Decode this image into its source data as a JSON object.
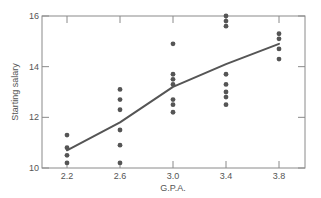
{
  "chart_data": {
    "type": "scatter",
    "title": "",
    "xlabel": "G.P.A.",
    "ylabel": "Starting salary",
    "xlim": [
      2.0,
      4.0
    ],
    "ylim": [
      10,
      16
    ],
    "x_ticks": [
      2.2,
      2.6,
      3.0,
      3.4,
      3.8
    ],
    "x_tick_labels": [
      "2.2",
      "2.6",
      "3.0",
      "3.4",
      "3.8"
    ],
    "y_ticks": [
      10,
      12,
      14,
      16
    ],
    "y_tick_labels": [
      "10",
      "12",
      "14",
      "16"
    ],
    "grid": false,
    "legend": "none",
    "points": [
      {
        "x": 2.2,
        "y": 11.3
      },
      {
        "x": 2.2,
        "y": 10.8
      },
      {
        "x": 2.2,
        "y": 10.5
      },
      {
        "x": 2.2,
        "y": 10.2
      },
      {
        "x": 2.6,
        "y": 13.1
      },
      {
        "x": 2.6,
        "y": 12.7
      },
      {
        "x": 2.6,
        "y": 12.3
      },
      {
        "x": 2.6,
        "y": 11.5
      },
      {
        "x": 2.6,
        "y": 10.9
      },
      {
        "x": 2.6,
        "y": 10.2
      },
      {
        "x": 3.0,
        "y": 14.9
      },
      {
        "x": 3.0,
        "y": 13.7
      },
      {
        "x": 3.0,
        "y": 13.5
      },
      {
        "x": 3.0,
        "y": 13.3
      },
      {
        "x": 3.0,
        "y": 12.7
      },
      {
        "x": 3.0,
        "y": 12.5
      },
      {
        "x": 3.0,
        "y": 12.2
      },
      {
        "x": 3.4,
        "y": 16.0
      },
      {
        "x": 3.4,
        "y": 15.8
      },
      {
        "x": 3.4,
        "y": 15.6
      },
      {
        "x": 3.4,
        "y": 13.7
      },
      {
        "x": 3.4,
        "y": 13.3
      },
      {
        "x": 3.4,
        "y": 13.0
      },
      {
        "x": 3.4,
        "y": 12.8
      },
      {
        "x": 3.4,
        "y": 12.5
      },
      {
        "x": 3.8,
        "y": 15.3
      },
      {
        "x": 3.8,
        "y": 15.1
      },
      {
        "x": 3.8,
        "y": 14.7
      },
      {
        "x": 3.8,
        "y": 14.3
      }
    ],
    "series": [
      {
        "name": "Mean starting salary",
        "type": "line",
        "x": [
          2.2,
          2.6,
          3.0,
          3.4,
          3.8
        ],
        "values": [
          10.7,
          11.8,
          13.2,
          14.1,
          14.9
        ]
      }
    ],
    "colors": {
      "points": "#555555",
      "line": "#555555",
      "axes": "#8a8a8a",
      "text": "#555555"
    }
  }
}
